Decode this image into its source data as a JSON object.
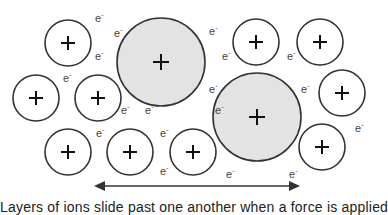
{
  "diagram": {
    "ion_label": "+",
    "electron_label": "e",
    "electron_charge": "-",
    "colors": {
      "background": "#ffffff",
      "small_ion_fill": "#ffffff",
      "large_ion_fill": "#e3e3e3",
      "stroke": "#333333",
      "arrow": "#333333"
    },
    "small_ions": [
      {
        "cx": 68,
        "cy": 43,
        "r": 23
      },
      {
        "cx": 36,
        "cy": 98,
        "r": 23
      },
      {
        "cx": 98,
        "cy": 98,
        "r": 23
      },
      {
        "cx": 256,
        "cy": 42,
        "r": 23
      },
      {
        "cx": 320,
        "cy": 42,
        "r": 23
      },
      {
        "cx": 342,
        "cy": 93,
        "r": 23
      },
      {
        "cx": 68,
        "cy": 152,
        "r": 23
      },
      {
        "cx": 130,
        "cy": 152,
        "r": 23
      },
      {
        "cx": 193,
        "cy": 152,
        "r": 23
      },
      {
        "cx": 322,
        "cy": 147,
        "r": 23
      }
    ],
    "large_ions": [
      {
        "cx": 161,
        "cy": 62,
        "r": 44
      },
      {
        "cx": 257,
        "cy": 117,
        "r": 44
      }
    ],
    "electrons": [
      {
        "x": 95,
        "y": 22
      },
      {
        "x": 114,
        "y": 37
      },
      {
        "x": 95,
        "y": 60
      },
      {
        "x": 63,
        "y": 82
      },
      {
        "x": 209,
        "y": 35
      },
      {
        "x": 222,
        "y": 60
      },
      {
        "x": 287,
        "y": 60
      },
      {
        "x": 209,
        "y": 93
      },
      {
        "x": 301,
        "y": 93
      },
      {
        "x": 121,
        "y": 114
      },
      {
        "x": 145,
        "y": 114
      },
      {
        "x": 215,
        "y": 114
      },
      {
        "x": 96,
        "y": 137
      },
      {
        "x": 160,
        "y": 137
      },
      {
        "x": 160,
        "y": 175
      },
      {
        "x": 226,
        "y": 178
      },
      {
        "x": 289,
        "y": 178
      },
      {
        "x": 355,
        "y": 132
      }
    ],
    "arrow": {
      "x1": 94,
      "x2": 300,
      "y": 186,
      "direction": "double-headed"
    },
    "caption": "Layers of ions slide past one another when a force is applied"
  }
}
